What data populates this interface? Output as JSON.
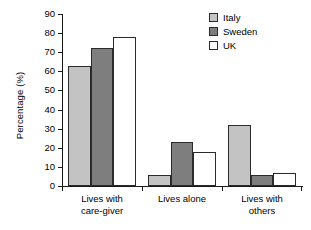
{
  "chart_data": {
    "type": "bar",
    "title": "",
    "xlabel": "",
    "ylabel": "Percentage (%)",
    "ylim": [
      0,
      90
    ],
    "ytick_step": 10,
    "yticks": [
      0,
      10,
      20,
      30,
      40,
      50,
      60,
      70,
      80,
      90
    ],
    "grid": false,
    "legend_position": "top-right",
    "categories": [
      "Lives with\ncare-giver",
      "Lives alone",
      "Lives with\nothers"
    ],
    "series": [
      {
        "name": "Italy",
        "color": "#c3c3c3",
        "values": [
          63,
          6,
          32
        ]
      },
      {
        "name": "Sweden",
        "color": "#7e7e7e",
        "values": [
          72,
          23,
          6
        ]
      },
      {
        "name": "UK",
        "color": "#ffffff",
        "values": [
          78,
          18,
          7
        ]
      }
    ]
  },
  "axis": {
    "y_title": "Percentage (%)",
    "y_labels": [
      "90",
      "80",
      "70",
      "60",
      "50",
      "40",
      "30",
      "20",
      "10",
      "0"
    ],
    "category_labels": [
      "Lives with\ncare-giver",
      "Lives alone",
      "Lives with\nothers"
    ]
  },
  "legend": {
    "items": [
      {
        "label": "Italy"
      },
      {
        "label": "Sweden"
      },
      {
        "label": "UK"
      }
    ]
  }
}
